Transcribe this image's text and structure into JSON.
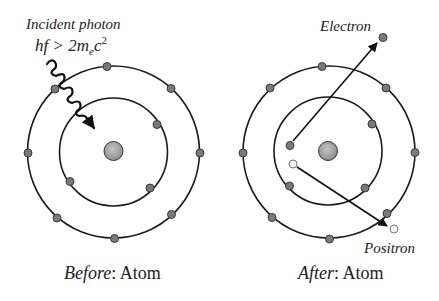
{
  "colors": {
    "orbit": "#1a1a1a",
    "electron_fill": "#7a7a7a",
    "electron_stroke": "#3a3a3a",
    "positron_fill": "#f4f4f4",
    "nucleus_fill": "#a0a0a0",
    "text": "#222222"
  },
  "before": {
    "caption_italic": "Before",
    "caption_rest": ": Atom",
    "photon_label": "Incident photon",
    "photon_condition": {
      "lhs": "hf > 2m",
      "subscript": "e",
      "c": "c",
      "superscript": "2"
    }
  },
  "after": {
    "caption_italic": "After",
    "caption_rest": ": Atom",
    "electron_label": "Electron",
    "positron_label": "Positron"
  }
}
